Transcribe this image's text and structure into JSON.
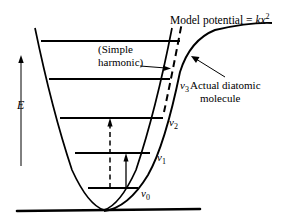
{
  "figure": {
    "title": {
      "prefix": "Model potential = ",
      "k": "k",
      "x": "x",
      "exp": "2"
    },
    "axis": {
      "energy_label": "E"
    },
    "annotations": {
      "simple_harmonic_line1": "(Simple",
      "simple_harmonic_line2": "harmonic)",
      "actual_line1": "Actual diatomic",
      "actual_line2": "molecule"
    },
    "levels": [
      {
        "name": "v4",
        "label": "",
        "sub": "",
        "y": 41,
        "x1": 41,
        "x2": 180
      },
      {
        "name": "v3",
        "label": "v",
        "sub": "3",
        "y": 79,
        "x1": 49,
        "x2": 170
      },
      {
        "name": "v2",
        "label": "v",
        "sub": "2",
        "y": 118,
        "x1": 60,
        "x2": 163
      },
      {
        "name": "v1",
        "label": "v",
        "sub": "1",
        "y": 153,
        "x1": 75,
        "x2": 150
      },
      {
        "name": "v0",
        "label": "v",
        "sub": "0",
        "y": 188,
        "x1": 88,
        "x2": 138
      }
    ],
    "transitions": [
      {
        "name": "fundamental-transition",
        "style": "solid",
        "from_level": "v0",
        "to_level": "v1"
      },
      {
        "name": "overtone-transition",
        "style": "dashed",
        "from_level": "v0",
        "to_level": "v2"
      }
    ],
    "colors": {
      "ink": "#000000",
      "background": "#ffffff"
    }
  }
}
